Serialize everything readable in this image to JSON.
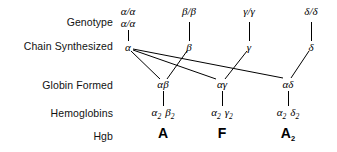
{
  "figure": {
    "background": "#ffffff",
    "line_color": "#000000"
  },
  "row_labels": [
    {
      "id": "genotype",
      "label": "Genotype"
    },
    {
      "id": "chain-synthesized",
      "label": "Chain Synthesized"
    },
    {
      "id": "globin-formed",
      "label": "Globin Formed"
    },
    {
      "id": "hemoglobins",
      "label": "Hemoglobins"
    },
    {
      "id": "hgb",
      "label": "Hgb"
    }
  ],
  "genotypes": [
    {
      "id": "alpha",
      "line1": "α/α",
      "line2": "α/α"
    },
    {
      "id": "beta",
      "line1": "β/β",
      "line2": ""
    },
    {
      "id": "gamma",
      "line1": "γ/γ",
      "line2": ""
    },
    {
      "id": "delta",
      "line1": "δ/δ",
      "line2": ""
    }
  ],
  "chains": [
    {
      "id": "alpha",
      "label": "α"
    },
    {
      "id": "beta",
      "label": "β"
    },
    {
      "id": "gamma",
      "label": "γ"
    },
    {
      "id": "delta",
      "label": "δ"
    }
  ],
  "globins": [
    {
      "id": "alpha-beta",
      "label": "αβ"
    },
    {
      "id": "alpha-gamma",
      "label": "αγ"
    },
    {
      "id": "alpha-delta",
      "label": "αδ"
    }
  ],
  "hemoglobins": [
    {
      "id": "a2b2",
      "first": "α",
      "first_sub": "2",
      "second": "β",
      "second_sub": "2"
    },
    {
      "id": "a2g2",
      "first": "α",
      "first_sub": "2",
      "second": "γ",
      "second_sub": "2"
    },
    {
      "id": "a2d2",
      "first": "α",
      "first_sub": "2",
      "second": "δ",
      "second_sub": "2"
    }
  ],
  "hgb": [
    {
      "id": "hgb-a",
      "label": "A",
      "sub": ""
    },
    {
      "id": "hgb-f",
      "label": "F",
      "sub": ""
    },
    {
      "id": "hgb-a2",
      "label": "A",
      "sub": "2"
    }
  ]
}
